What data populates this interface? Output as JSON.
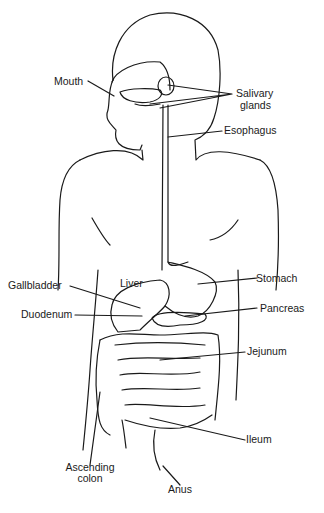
{
  "diagram": {
    "labels": {
      "mouth": "Mouth",
      "salivary_1": "Salivary",
      "salivary_2": "glands",
      "esophagus": "Esophagus",
      "liver": "Liver",
      "stomach": "Stomach",
      "gallbladder": "Gallbladder",
      "pancreas": "Pancreas",
      "duodenum": "Duodenum",
      "jejunum": "Jejunum",
      "ileum": "Ileum",
      "ascending_1": "Ascending",
      "ascending_2": "colon",
      "anus": "Anus"
    },
    "colors": {
      "line": "#1a1a1a",
      "background": "#ffffff"
    }
  }
}
